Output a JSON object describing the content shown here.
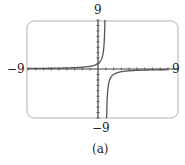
{
  "chart_data": {
    "type": "line",
    "title": "",
    "caption": "(a)",
    "function": "y = 1/(1 - x)",
    "vertical_asymptote": 1,
    "horizontal_asymptote": 0,
    "xlim": [
      -9,
      9
    ],
    "ylim": [
      -9,
      9
    ],
    "xtick_step": 1,
    "ytick_step": 1,
    "grid": false,
    "legend": null
  },
  "labels": {
    "x_min": "−9",
    "x_max": "9",
    "y_max": "9",
    "y_min": "−9",
    "caption": "(a)"
  },
  "colors": {
    "frame": "#b0b0b0",
    "axis": "#444444",
    "curve": "#555555"
  }
}
